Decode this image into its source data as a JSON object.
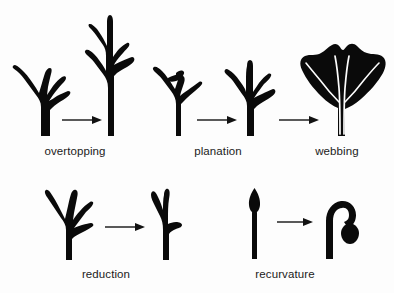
{
  "figure": {
    "background_color": "#fdfdfd",
    "ink_color": "#0a0a0a",
    "vein_color": "#fdfdfd",
    "width": 394,
    "height": 293
  },
  "rows": [
    {
      "row_name": "top-row",
      "stages": [
        {
          "label": "overtopping",
          "label_x": 38,
          "label_y": 145,
          "arrow": {
            "x": 62,
            "y": 120,
            "length": 36
          },
          "before_name": "dichotomous-branch-system",
          "after_name": "overtopped-branch-system"
        },
        {
          "label": "planation",
          "label_x": 187,
          "label_y": 145,
          "arrow": {
            "x": 197,
            "y": 120,
            "length": 36
          },
          "before_name": "three-dimensional-branch-system",
          "after_name": "planated-branch-system"
        },
        {
          "label": "webbing",
          "label_x": 309,
          "label_y": 145,
          "arrow": {
            "x": 279,
            "y": 120,
            "length": 36
          },
          "before_name": "planated-branch-system",
          "after_name": "webbed-fan-leaf"
        }
      ]
    },
    {
      "row_name": "bottom-row",
      "stages": [
        {
          "label": "reduction",
          "label_x": 74,
          "label_y": 268,
          "arrow": {
            "x": 105,
            "y": 227,
            "length": 36
          },
          "before_name": "branch-system-many-tips",
          "after_name": "reduced-branch-system"
        },
        {
          "label": "recurvature",
          "label_x": 246,
          "label_y": 268,
          "arrow": {
            "x": 277,
            "y": 222,
            "length": 32
          },
          "before_name": "erect-sporangium-axis",
          "after_name": "recurved-sporangium-axis"
        }
      ]
    }
  ],
  "labels": {
    "overtopping": "overtopping",
    "planation": "planation",
    "webbing": "webbing",
    "reduction": "reduction",
    "recurvature": "recurvature"
  }
}
